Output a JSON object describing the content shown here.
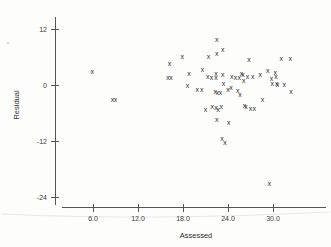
{
  "chart_data": {
    "type": "scatter",
    "title": "",
    "xlabel": "Assessed",
    "ylabel": "Residual",
    "xlim": [
      2.0,
      34.5
    ],
    "ylim": [
      -27.5,
      14.5
    ],
    "xticks": [
      6.0,
      12.0,
      18.0,
      24.0,
      30.0
    ],
    "xtick_labels": [
      "6.0",
      "12.0",
      "18.0",
      "24.0",
      "30.0"
    ],
    "yticks": [
      12,
      0,
      -12,
      -24
    ],
    "ytick_labels": [
      "12",
      "0",
      "-12",
      "-24"
    ],
    "grid": false,
    "legend": false,
    "marker": "x",
    "marker_color": "#2b2b2b",
    "points": [
      {
        "x": 5.9,
        "y": 2.9
      },
      {
        "x": 8.6,
        "y": -3.2
      },
      {
        "x": 9.0,
        "y": -3.2
      },
      {
        "x": 16.2,
        "y": 4.6
      },
      {
        "x": 16.0,
        "y": 1.6
      },
      {
        "x": 16.4,
        "y": 1.7
      },
      {
        "x": 17.9,
        "y": 6.1
      },
      {
        "x": 18.8,
        "y": 2.5
      },
      {
        "x": 18.6,
        "y": 0.0
      },
      {
        "x": 19.9,
        "y": -0.9
      },
      {
        "x": 20.5,
        "y": -0.9
      },
      {
        "x": 20.6,
        "y": 3.4
      },
      {
        "x": 21.4,
        "y": 6.2
      },
      {
        "x": 21.3,
        "y": 1.9
      },
      {
        "x": 21.8,
        "y": 1.7
      },
      {
        "x": 22.5,
        "y": 9.7
      },
      {
        "x": 22.5,
        "y": 6.8
      },
      {
        "x": 22.4,
        "y": 2.4
      },
      {
        "x": 22.4,
        "y": 1.7
      },
      {
        "x": 22.3,
        "y": -1.3
      },
      {
        "x": 22.6,
        "y": -1.5
      },
      {
        "x": 23.0,
        "y": -1.6
      },
      {
        "x": 23.3,
        "y": 7.6
      },
      {
        "x": 23.3,
        "y": 2.3
      },
      {
        "x": 23.4,
        "y": 0.4
      },
      {
        "x": 23.1,
        "y": -4.6
      },
      {
        "x": 21.0,
        "y": -5.2
      },
      {
        "x": 21.9,
        "y": -4.5
      },
      {
        "x": 22.4,
        "y": -4.8
      },
      {
        "x": 22.7,
        "y": -5.3
      },
      {
        "x": 22.5,
        "y": -7.3
      },
      {
        "x": 23.2,
        "y": -11.4
      },
      {
        "x": 23.6,
        "y": -12.4
      },
      {
        "x": 24.1,
        "y": -8.0
      },
      {
        "x": 24.0,
        "y": -0.9
      },
      {
        "x": 24.4,
        "y": -0.6
      },
      {
        "x": 24.5,
        "y": 1.9
      },
      {
        "x": 25.0,
        "y": 1.6
      },
      {
        "x": 25.3,
        "y": -1.1
      },
      {
        "x": 25.5,
        "y": 1.6
      },
      {
        "x": 25.6,
        "y": -2.0
      },
      {
        "x": 25.8,
        "y": 2.4
      },
      {
        "x": 26.0,
        "y": 2.2
      },
      {
        "x": 26.1,
        "y": 1.0
      },
      {
        "x": 26.2,
        "y": -4.4
      },
      {
        "x": 26.4,
        "y": -4.6
      },
      {
        "x": 26.6,
        "y": 1.8
      },
      {
        "x": 26.8,
        "y": 5.5
      },
      {
        "x": 27.0,
        "y": -5.0
      },
      {
        "x": 27.3,
        "y": 1.9
      },
      {
        "x": 27.5,
        "y": -5.1
      },
      {
        "x": 28.3,
        "y": 2.3
      },
      {
        "x": 28.6,
        "y": -3.1
      },
      {
        "x": 29.3,
        "y": 3.1
      },
      {
        "x": 29.5,
        "y": -21.0
      },
      {
        "x": 29.8,
        "y": 1.5
      },
      {
        "x": 29.9,
        "y": 0.3
      },
      {
        "x": 30.3,
        "y": 2.6
      },
      {
        "x": 30.4,
        "y": 1.9
      },
      {
        "x": 30.5,
        "y": 0.4
      },
      {
        "x": 30.6,
        "y": 0.2
      },
      {
        "x": 31.1,
        "y": 5.7
      },
      {
        "x": 31.5,
        "y": 0.1
      },
      {
        "x": 32.3,
        "y": 5.6
      },
      {
        "x": 32.4,
        "y": -1.4
      }
    ]
  }
}
